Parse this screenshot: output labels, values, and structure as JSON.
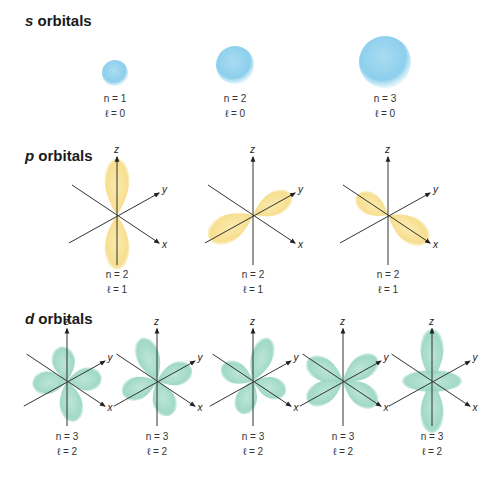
{
  "sections": [
    {
      "id": "s",
      "letter": "s",
      "title_rest": " orbitals",
      "top": 12
    },
    {
      "id": "p",
      "letter": "p",
      "title_rest": " orbitals",
      "top": 147
    },
    {
      "id": "d",
      "letter": "d",
      "title_rest": " orbitals",
      "top": 310
    }
  ],
  "s_orbitals": [
    {
      "cx": 115,
      "cy": 73,
      "r": 13,
      "n": "n = 1",
      "l": "ℓ = 0"
    },
    {
      "cx": 235,
      "cy": 65,
      "r": 19,
      "n": "n = 2",
      "l": "ℓ = 0"
    },
    {
      "cx": 385,
      "cy": 62,
      "r": 26,
      "n": "n = 3",
      "l": "ℓ = 0"
    }
  ],
  "p_orbitals": [
    {
      "cx": 117,
      "n": "n = 2",
      "l": "ℓ = 1",
      "orientation": "z"
    },
    {
      "cx": 253,
      "n": "n = 2",
      "l": "ℓ = 1",
      "orientation": "y"
    },
    {
      "cx": 388,
      "n": "n = 2",
      "l": "ℓ = 1",
      "orientation": "x"
    }
  ],
  "d_orbitals": [
    {
      "cx": 67,
      "n": "n = 3",
      "l": "ℓ = 2",
      "shape": "dxy"
    },
    {
      "cx": 157,
      "n": "n = 3",
      "l": "ℓ = 2",
      "shape": "dyz"
    },
    {
      "cx": 253,
      "n": "n = 3",
      "l": "ℓ = 2",
      "shape": "dxz"
    },
    {
      "cx": 343,
      "n": "n = 3",
      "l": "ℓ = 2",
      "shape": "dx2y2"
    },
    {
      "cx": 432,
      "n": "n = 3",
      "l": "ℓ = 2",
      "shape": "dz2"
    }
  ],
  "axis_labels": {
    "x": "x",
    "y": "y",
    "z": "z"
  },
  "colors": {
    "s": "#8fd0ec",
    "p": "#f7df8c",
    "d": "#9fd8c6",
    "axis": "#333333"
  }
}
